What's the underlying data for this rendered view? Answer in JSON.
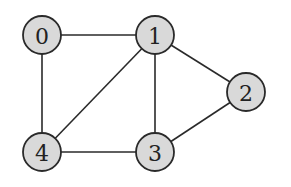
{
  "graph": {
    "type": "undirected",
    "node_fill": "#d9d9d9",
    "stroke_color": "#2a2a2a",
    "nodes": [
      {
        "id": "0",
        "label": "0",
        "x": 42,
        "y": 35
      },
      {
        "id": "1",
        "label": "1",
        "x": 155,
        "y": 35
      },
      {
        "id": "2",
        "label": "2",
        "x": 246,
        "y": 92
      },
      {
        "id": "3",
        "label": "3",
        "x": 155,
        "y": 152
      },
      {
        "id": "4",
        "label": "4",
        "x": 42,
        "y": 152
      }
    ],
    "edges": [
      [
        "0",
        "1"
      ],
      [
        "0",
        "4"
      ],
      [
        "1",
        "2"
      ],
      [
        "1",
        "3"
      ],
      [
        "1",
        "4"
      ],
      [
        "2",
        "3"
      ],
      [
        "3",
        "4"
      ]
    ]
  }
}
